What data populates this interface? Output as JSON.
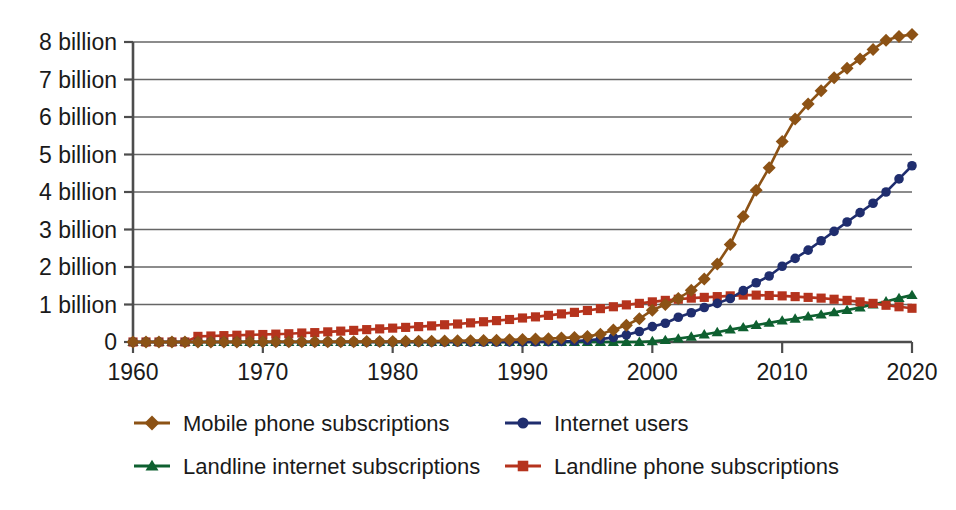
{
  "chart_data": {
    "type": "line",
    "title": "",
    "subtitle": "",
    "xlabel": "",
    "ylabel": "",
    "xlim": [
      1960,
      2020
    ],
    "ylim": [
      0,
      8.6
    ],
    "grid": true,
    "legend_position": "bottom",
    "x_ticks": [
      1960,
      1970,
      1980,
      1990,
      2000,
      2010,
      2020
    ],
    "x_tick_labels": [
      "1960",
      "1970",
      "1980",
      "1990",
      "2000",
      "2010",
      "2020"
    ],
    "y_ticks": [
      0,
      1,
      2,
      3,
      4,
      5,
      6,
      7,
      8
    ],
    "y_tick_labels": [
      "0",
      "1 billion",
      "2 billion",
      "3 billion",
      "4 billion",
      "5 billion",
      "6 billion",
      "7 billion",
      "8 billion"
    ],
    "y_unit": "billion",
    "x": [
      1960,
      1961,
      1962,
      1963,
      1964,
      1965,
      1966,
      1967,
      1968,
      1969,
      1970,
      1971,
      1972,
      1973,
      1974,
      1975,
      1976,
      1977,
      1978,
      1979,
      1980,
      1981,
      1982,
      1983,
      1984,
      1985,
      1986,
      1987,
      1988,
      1989,
      1990,
      1991,
      1992,
      1993,
      1994,
      1995,
      1996,
      1997,
      1998,
      1999,
      2000,
      2001,
      2002,
      2003,
      2004,
      2005,
      2006,
      2007,
      2008,
      2009,
      2010,
      2011,
      2012,
      2013,
      2014,
      2015,
      2016,
      2017,
      2018,
      2019,
      2020
    ],
    "series": [
      {
        "name": "Mobile phone subscriptions",
        "color": "#8c5215",
        "marker": "diamond",
        "values": [
          0,
          0,
          0,
          0,
          0,
          0.002,
          0.002,
          0.003,
          0.003,
          0.004,
          0.004,
          0.005,
          0.005,
          0.006,
          0.007,
          0.008,
          0.009,
          0.01,
          0.011,
          0.013,
          0.015,
          0.017,
          0.02,
          0.023,
          0.027,
          0.031,
          0.036,
          0.042,
          0.049,
          0.057,
          0.066,
          0.077,
          0.09,
          0.105,
          0.123,
          0.145,
          0.21,
          0.32,
          0.45,
          0.62,
          0.85,
          1.0,
          1.16,
          1.38,
          1.68,
          2.08,
          2.6,
          3.35,
          4.05,
          4.65,
          5.35,
          5.95,
          6.35,
          6.7,
          7.05,
          7.3,
          7.55,
          7.8,
          8.05,
          8.15,
          8.2
        ]
      },
      {
        "name": "Internet users",
        "color": "#1f2d6e",
        "marker": "circle",
        "values": [
          0,
          0,
          0,
          0,
          0,
          0,
          0,
          0,
          0,
          0,
          0,
          0,
          0,
          0,
          0,
          0,
          0,
          0,
          0,
          0,
          0,
          0,
          0,
          0,
          0,
          0,
          0,
          0,
          0,
          0.002,
          0.003,
          0.005,
          0.008,
          0.014,
          0.025,
          0.044,
          0.077,
          0.12,
          0.19,
          0.28,
          0.41,
          0.5,
          0.66,
          0.78,
          0.92,
          1.03,
          1.16,
          1.37,
          1.58,
          1.76,
          2.02,
          2.23,
          2.45,
          2.7,
          2.95,
          3.2,
          3.45,
          3.7,
          4.0,
          4.35,
          4.7
        ]
      },
      {
        "name": "Landline internet subscriptions",
        "color": "#0e6030",
        "marker": "triangle",
        "values": [
          0,
          0,
          0,
          0,
          0,
          0,
          0,
          0,
          0,
          0,
          0,
          0,
          0,
          0,
          0,
          0,
          0,
          0,
          0,
          0,
          0,
          0,
          0,
          0,
          0,
          0,
          0,
          0,
          0,
          0,
          0,
          0,
          0,
          0,
          0,
          0,
          0,
          0,
          0,
          0,
          0.02,
          0.05,
          0.09,
          0.14,
          0.2,
          0.26,
          0.33,
          0.39,
          0.45,
          0.51,
          0.57,
          0.62,
          0.68,
          0.73,
          0.79,
          0.85,
          0.92,
          1.0,
          1.08,
          1.17,
          1.25
        ]
      },
      {
        "name": "Landline phone subscriptions",
        "color": "#b5331d",
        "marker": "square",
        "values": [
          0,
          0,
          0,
          0,
          0,
          0.15,
          0.16,
          0.17,
          0.18,
          0.19,
          0.2,
          0.21,
          0.22,
          0.24,
          0.25,
          0.27,
          0.29,
          0.31,
          0.33,
          0.35,
          0.37,
          0.39,
          0.41,
          0.43,
          0.46,
          0.48,
          0.51,
          0.54,
          0.57,
          0.6,
          0.64,
          0.67,
          0.71,
          0.75,
          0.79,
          0.84,
          0.89,
          0.94,
          0.99,
          1.03,
          1.07,
          1.11,
          1.14,
          1.17,
          1.19,
          1.21,
          1.23,
          1.25,
          1.25,
          1.24,
          1.23,
          1.21,
          1.19,
          1.17,
          1.14,
          1.11,
          1.07,
          1.03,
          0.98,
          0.94,
          0.9
        ]
      }
    ],
    "legend": [
      {
        "label": "Mobile phone subscriptions",
        "color": "#8c5215",
        "marker": "diamond"
      },
      {
        "label": "Internet users",
        "color": "#1f2d6e",
        "marker": "circle"
      },
      {
        "label": "Landline internet subscriptions",
        "color": "#0e6030",
        "marker": "triangle"
      },
      {
        "label": "Landline phone subscriptions",
        "color": "#b5331d",
        "marker": "square"
      }
    ]
  }
}
